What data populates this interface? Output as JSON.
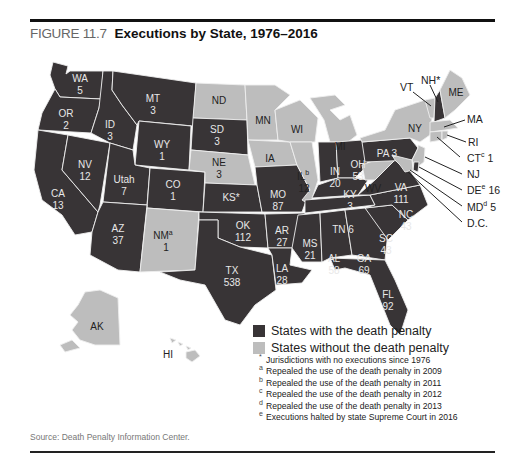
{
  "figure": {
    "number": "FIGURE 11.7",
    "title": "Executions by State, 1976–2016",
    "source": "Source: Death Penalty Information Center."
  },
  "colors": {
    "with_death_penalty": "#383436",
    "without_death_penalty": "#bdbdbd",
    "border": "#eeeeee"
  },
  "legend": {
    "items": [
      {
        "label": "States with the death penalty",
        "color": "#383436"
      },
      {
        "label": "States without the death penalty",
        "color": "#bdbdbd"
      }
    ]
  },
  "notes": [
    {
      "mark": "*",
      "text": "Jurisdictions with no executions since 1976"
    },
    {
      "mark": "a",
      "text": "Repealed the use of the death penalty in 2009"
    },
    {
      "mark": "b",
      "text": "Repealed the use of the death penalty in 2011"
    },
    {
      "mark": "c",
      "text": "Repealed the use of the death penalty in 2012"
    },
    {
      "mark": "d",
      "text": "Repealed the use of the death penalty in 2013"
    },
    {
      "mark": "e",
      "text": "Executions halted by state Supreme Court in 2016"
    }
  ],
  "states": {
    "WA": {
      "label": "WA",
      "value": "5",
      "death_penalty": true
    },
    "OR": {
      "label": "OR",
      "value": "2",
      "death_penalty": true
    },
    "CA": {
      "label": "CA",
      "value": "13",
      "death_penalty": true
    },
    "NV": {
      "label": "NV",
      "value": "12",
      "death_penalty": true
    },
    "ID": {
      "label": "ID",
      "value": "3",
      "death_penalty": true
    },
    "MT": {
      "label": "MT",
      "value": "3",
      "death_penalty": true
    },
    "WY": {
      "label": "WY",
      "value": "1",
      "death_penalty": true
    },
    "UT": {
      "label": "Utah",
      "value": "7",
      "death_penalty": true
    },
    "CO": {
      "label": "CO",
      "value": "1",
      "death_penalty": true
    },
    "AZ": {
      "label": "AZ",
      "value": "37",
      "death_penalty": true
    },
    "NM": {
      "label": "NM",
      "mark": "a",
      "value": "1",
      "death_penalty": false
    },
    "ND": {
      "label": "ND",
      "value": "",
      "death_penalty": false
    },
    "SD": {
      "label": "SD",
      "value": "3",
      "death_penalty": true
    },
    "NE": {
      "label": "NE",
      "value": "3",
      "death_penalty": false
    },
    "KS": {
      "label": "KS*",
      "value": "",
      "death_penalty": true
    },
    "OK": {
      "label": "OK",
      "value": "112",
      "death_penalty": true
    },
    "TX": {
      "label": "TX",
      "value": "538",
      "death_penalty": true
    },
    "MN": {
      "label": "MN",
      "value": "",
      "death_penalty": false
    },
    "IA": {
      "label": "IA",
      "value": "",
      "death_penalty": false
    },
    "MO": {
      "label": "MO",
      "value": "87",
      "death_penalty": true
    },
    "AR": {
      "label": "AR",
      "value": "27",
      "death_penalty": true
    },
    "LA": {
      "label": "LA",
      "value": "28",
      "death_penalty": true
    },
    "WI": {
      "label": "WI",
      "value": "",
      "death_penalty": false
    },
    "IL": {
      "label": "IL",
      "mark": "b",
      "value": "12",
      "death_penalty": false
    },
    "MI": {
      "label": "MI",
      "value": "",
      "death_penalty": false
    },
    "IN": {
      "label": "IN",
      "value": "20",
      "death_penalty": true
    },
    "OH": {
      "label": "OH",
      "value": "53",
      "death_penalty": true
    },
    "KY": {
      "label": "KY",
      "value": "3",
      "death_penalty": true
    },
    "TN": {
      "label": "TN 6",
      "value": "6",
      "death_penalty": true
    },
    "MS": {
      "label": "MS",
      "value": "21",
      "death_penalty": true
    },
    "AL": {
      "label": "AL",
      "value": "58",
      "death_penalty": true
    },
    "GA": {
      "label": "GA",
      "value": "69",
      "death_penalty": true
    },
    "FL": {
      "label": "FL",
      "value": "92",
      "death_penalty": true
    },
    "SC": {
      "label": "SC",
      "value": "43",
      "death_penalty": true
    },
    "NC": {
      "label": "NC",
      "value": "43",
      "death_penalty": true
    },
    "VA": {
      "label": "VA",
      "value": "111",
      "death_penalty": true
    },
    "WV": {
      "label": "WV",
      "value": "",
      "death_penalty": false
    },
    "PA": {
      "label": "PA 3",
      "value": "3",
      "death_penalty": true
    },
    "NY": {
      "label": "NY",
      "value": "",
      "death_penalty": false
    },
    "VT": {
      "label": "VT",
      "value": "",
      "death_penalty": false
    },
    "NH": {
      "label": "NH*",
      "value": "",
      "death_penalty": true
    },
    "ME": {
      "label": "ME",
      "value": "",
      "death_penalty": false
    },
    "MA": {
      "label": "MA",
      "value": "",
      "death_penalty": false
    },
    "RI": {
      "label": "RI",
      "value": "",
      "death_penalty": false
    },
    "CT": {
      "label": "CT",
      "mark": "c",
      "value": "1",
      "death_penalty": false
    },
    "NJ": {
      "label": "NJ",
      "value": "",
      "death_penalty": false
    },
    "DE": {
      "label": "DE",
      "mark": "e",
      "value": "16",
      "death_penalty": true
    },
    "MD": {
      "label": "MD",
      "mark": "d",
      "value": "5",
      "death_penalty": false
    },
    "DC": {
      "label": "D.C.",
      "value": "",
      "death_penalty": false
    },
    "AK": {
      "label": "AK",
      "value": "",
      "death_penalty": false
    },
    "HI": {
      "label": "HI",
      "value": "",
      "death_penalty": false
    }
  }
}
